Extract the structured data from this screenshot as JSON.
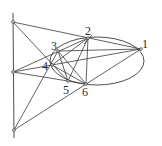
{
  "diagram": {
    "title": "",
    "stroke_color": "#3a3a3a",
    "ellipse": {
      "cx": 97,
      "cy": 61,
      "rx": 47,
      "ry": 24
    },
    "points": [
      {
        "id": "1",
        "label": "1",
        "x": 141,
        "y": 49,
        "lx": 142,
        "ly": 38
      },
      {
        "id": "2",
        "label": "2",
        "x": 88,
        "y": 38,
        "lx": 85,
        "ly": 25
      },
      {
        "id": "3",
        "label": "3",
        "x": 58,
        "y": 51,
        "lx": 51,
        "ly": 40
      },
      {
        "id": "4",
        "label": "4",
        "x": 52,
        "y": 65,
        "lx": 42,
        "ly": 60
      },
      {
        "id": "5",
        "label": "5",
        "x": 68,
        "y": 81,
        "lx": 63,
        "ly": 84
      },
      {
        "id": "6",
        "label": "6",
        "x": 86,
        "y": 84,
        "lx": 82,
        "ly": 86
      }
    ],
    "pascal_points": [
      {
        "id": "P12_45",
        "x": 13,
        "y": 22
      },
      {
        "id": "P23_56",
        "x": 13,
        "y": 72
      },
      {
        "id": "P34_61",
        "x": 14,
        "y": 130
      }
    ],
    "pascal_line": {
      "x1": 13,
      "y1": 13,
      "x2": 14,
      "y2": 138
    },
    "segments": [
      [
        13,
        22,
        141,
        49
      ],
      [
        13,
        22,
        68,
        81
      ],
      [
        13,
        72,
        88,
        38
      ],
      [
        13,
        72,
        86,
        84
      ],
      [
        13,
        72,
        141,
        49
      ],
      [
        14,
        130,
        141,
        49
      ],
      [
        14,
        130,
        58,
        51
      ],
      [
        141,
        49,
        58,
        51
      ],
      [
        88,
        38,
        68,
        81
      ],
      [
        88,
        38,
        86,
        84
      ],
      [
        58,
        51,
        86,
        84
      ],
      [
        58,
        51,
        68,
        81
      ],
      [
        52,
        65,
        86,
        84
      ],
      [
        52,
        65,
        88,
        38
      ],
      [
        84,
        44,
        92,
        35
      ]
    ]
  }
}
